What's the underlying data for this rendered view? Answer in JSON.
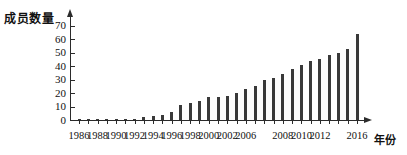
{
  "chart_data": {
    "type": "bar",
    "title": "",
    "subtitle": "",
    "xlabel": "年份",
    "ylabel": "成员数量",
    "grid": false,
    "legend": null,
    "xlim": [
      1985.2,
      2017.2
    ],
    "ylim": [
      0,
      75
    ],
    "y_ticks": [
      0,
      10,
      20,
      30,
      40,
      50,
      60,
      70
    ],
    "x_tick_labels": [
      "1986",
      "1988",
      "1990",
      "1992",
      "1994",
      "1996",
      "1998",
      "2000",
      "2002",
      "2006",
      "2008",
      "2010",
      "2012",
      "2016"
    ],
    "x_tick_label_years": [
      1986,
      1988,
      1990,
      1992,
      1994,
      1996,
      1998,
      2000,
      2002,
      2004,
      2008,
      2010,
      2012,
      2016
    ],
    "categories": [
      "1986",
      "1987",
      "1988",
      "1989",
      "1990",
      "1991",
      "1992",
      "1993",
      "1994",
      "1995",
      "1996",
      "1997",
      "1998",
      "1999",
      "2000",
      "2001",
      "2002",
      "2003",
      "2004",
      "2005",
      "2006",
      "2007",
      "2008",
      "2009",
      "2010",
      "2011",
      "2012",
      "2013",
      "2014",
      "2015",
      "2016"
    ],
    "values": [
      1,
      1,
      1,
      1,
      1,
      1,
      1,
      2,
      3,
      4,
      6,
      11,
      13,
      14,
      17,
      17,
      18,
      20,
      23,
      25,
      30,
      31,
      34,
      38,
      41,
      44,
      45,
      48,
      50,
      53,
      64
    ],
    "bar_color": "#3a3a3a",
    "axis_color": "#2b2b2b"
  },
  "axes": {
    "y_title": "成员数量",
    "x_title": "年份"
  }
}
